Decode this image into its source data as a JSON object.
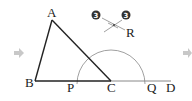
{
  "diagram": {
    "type": "geometric-construction",
    "points": {
      "A": {
        "label": "A",
        "x": 52,
        "y": 20
      },
      "B": {
        "label": "B",
        "x": 35,
        "y": 81
      },
      "C": {
        "label": "C",
        "x": 111,
        "y": 81
      },
      "P": {
        "label": "P",
        "x": 77,
        "y": 81
      },
      "Q": {
        "label": "Q",
        "x": 145,
        "y": 81
      },
      "D": {
        "label": "D",
        "x": 171,
        "y": 81
      },
      "R": {
        "label": "R",
        "x": 114,
        "y": 25
      }
    },
    "segments": [
      [
        "A",
        "B"
      ],
      [
        "B",
        "C"
      ],
      [
        "A",
        "C"
      ],
      [
        "C",
        "D"
      ]
    ],
    "arc": {
      "center": "C",
      "radius": 34,
      "from": "P",
      "to": "Q"
    },
    "step_badges": [
      {
        "text": "3",
        "x": 96,
        "y": 15
      },
      {
        "text": "3",
        "x": 126,
        "y": 15
      }
    ],
    "arrows": [
      {
        "name": "left-arrow",
        "glyph": "➡",
        "x": 20,
        "y": 53
      },
      {
        "name": "right-arrow",
        "glyph": "➡",
        "x": 187,
        "y": 53
      }
    ],
    "colors": {
      "line": "#222222",
      "thin_line": "#777777",
      "arrow": "#c8c8c8",
      "badge": "#333333"
    }
  }
}
